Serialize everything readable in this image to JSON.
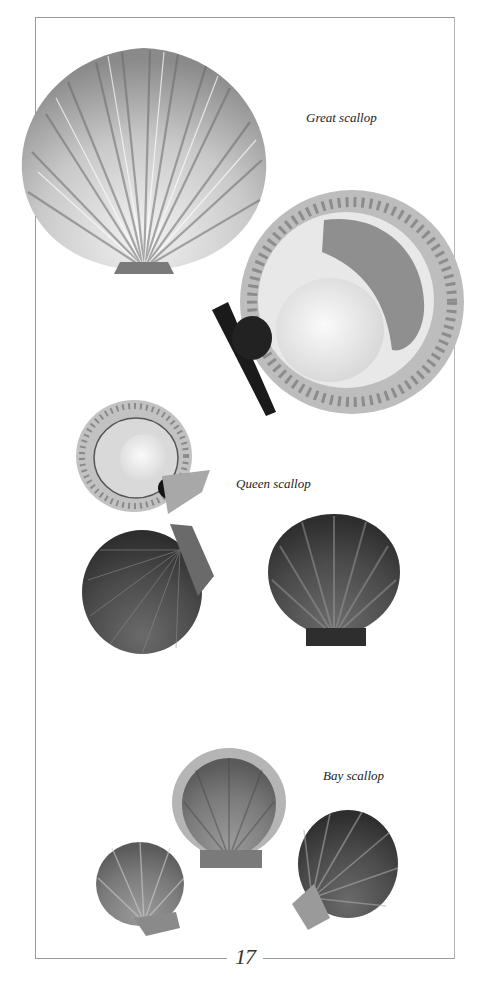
{
  "page": {
    "page_number": "17",
    "captions": {
      "great": "Great scallop",
      "queen": "Queen scallop",
      "bay": "Bay scallop"
    }
  },
  "figures": [
    {
      "name": "great-scallop-shell-exterior",
      "species": "Great scallop"
    },
    {
      "name": "great-scallop-opened",
      "species": "Great scallop"
    },
    {
      "name": "queen-scallop-opened",
      "species": "Queen scallop"
    },
    {
      "name": "queen-scallop-shell-left",
      "species": "Queen scallop"
    },
    {
      "name": "queen-scallop-shell-right",
      "species": "Queen scallop"
    },
    {
      "name": "bay-scallop-shell-center",
      "species": "Bay scallop"
    },
    {
      "name": "bay-scallop-shell-left",
      "species": "Bay scallop"
    },
    {
      "name": "bay-scallop-shell-right",
      "species": "Bay scallop"
    }
  ],
  "colors": {
    "frame": "#9a9a9a",
    "text": "#222222",
    "shell_dark": "#3a3a3a",
    "shell_mid": "#7a7a7a",
    "shell_light": "#d8d8d8",
    "roe": "#8f8f8f"
  }
}
